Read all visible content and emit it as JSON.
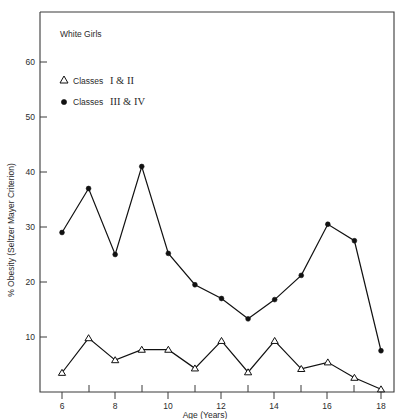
{
  "chart_data": {
    "type": "line",
    "title": "White Girls",
    "xlabel": "Age (Years)",
    "ylabel": "% Obesity (Seltzer Mayer Criterion)",
    "xlim": [
      5.2,
      18.9
    ],
    "ylim": [
      0,
      66
    ],
    "grid": false,
    "legend_position": "top-left-inside",
    "x_ticks_major": [
      6,
      8,
      10,
      12,
      14,
      16,
      18
    ],
    "x_ticks_minor": [
      7,
      9,
      11,
      13,
      15,
      17
    ],
    "y_ticks_major": [
      10,
      20,
      30,
      40,
      50,
      60
    ],
    "x": [
      6,
      7,
      8,
      9,
      10,
      11,
      12,
      13,
      14,
      15,
      16,
      17,
      18
    ],
    "series": [
      {
        "name": "Classes I & II",
        "marker": "open-triangle",
        "values": [
          3.5,
          9.8,
          5.8,
          7.7,
          7.7,
          4.3,
          9.3,
          3.6,
          9.3,
          4.2,
          5.4,
          2.6,
          0.5
        ]
      },
      {
        "name": "Classes III & IV",
        "marker": "filled-circle",
        "values": [
          29.0,
          37.0,
          25.0,
          41.0,
          25.2,
          19.5,
          17.0,
          13.3,
          16.8,
          21.2,
          30.5,
          27.5,
          7.5
        ]
      }
    ]
  },
  "legend": {
    "entries": [
      {
        "symbol": "open-triangle",
        "prefix": "Classes",
        "roman": "I & II"
      },
      {
        "symbol": "filled-circle",
        "prefix": "Classes",
        "roman": "III & IV"
      }
    ]
  },
  "labels": {
    "y_60": "60",
    "y_50": "50",
    "y_40": "40",
    "y_30": "30",
    "y_20": "20",
    "y_10": "10",
    "x_6": "6",
    "x_8": "8",
    "x_10": "10",
    "x_12": "12",
    "x_14": "14",
    "x_16": "16",
    "x_18": "18"
  }
}
